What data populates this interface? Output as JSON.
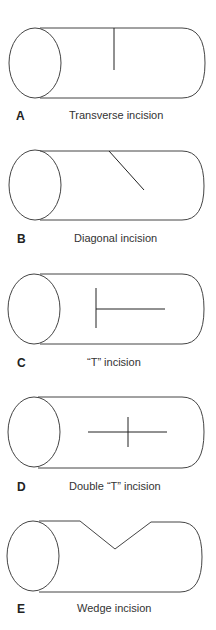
{
  "panels": [
    {
      "letter": "A",
      "caption": "Transverse incision",
      "type": "transverse"
    },
    {
      "letter": "B",
      "caption": "Diagonal incision",
      "type": "diagonal"
    },
    {
      "letter": "C",
      "caption": "“T” incision",
      "type": "t"
    },
    {
      "letter": "D",
      "caption": "Double “T” incision",
      "type": "double-t"
    },
    {
      "letter": "E",
      "caption": "Wedge incision",
      "type": "wedge"
    }
  ],
  "colors": {
    "stroke": "#333333",
    "background": "#ffffff"
  }
}
